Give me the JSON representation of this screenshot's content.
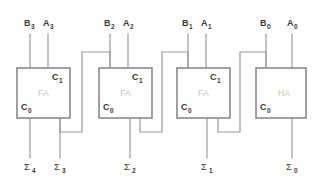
{
  "diagram": {
    "colors": {
      "background": "#ffffff",
      "wire": "#9a9a9a",
      "box_border": "#8a8a8a",
      "box_fill": "#ffffff",
      "text": "#3a3a3a",
      "block_label": "#c2c2c2"
    },
    "blocks": [
      {
        "id": "fa3",
        "type_label": "FA",
        "x": 17,
        "y": 68,
        "w": 53,
        "h": 50,
        "carry_out_label": "C",
        "carry_out_sub": "1",
        "carry_in_label": "C",
        "carry_in_sub": "0",
        "input_b": "B",
        "input_b_sub": "3",
        "input_a": "A",
        "input_a_sub": "3",
        "sum_label": "Σ",
        "sum_sub": "3",
        "extra_sum_label": "Σ",
        "extra_sum_sub": "4"
      },
      {
        "id": "fa2",
        "type_label": "FA",
        "x": 99,
        "y": 68,
        "w": 53,
        "h": 50,
        "carry_out_label": "C",
        "carry_out_sub": "1",
        "carry_in_label": "C",
        "carry_in_sub": "0",
        "input_b": "B",
        "input_b_sub": "2",
        "input_a": "A",
        "input_a_sub": "2",
        "sum_label": "Σ",
        "sum_sub": "2"
      },
      {
        "id": "fa1",
        "type_label": "FA",
        "x": 177,
        "y": 68,
        "w": 53,
        "h": 50,
        "carry_out_label": "C",
        "carry_out_sub": "1",
        "carry_in_label": "C",
        "carry_in_sub": "0",
        "input_b": "B",
        "input_b_sub": "1",
        "input_a": "A",
        "input_a_sub": "1",
        "sum_label": "Σ",
        "sum_sub": "1"
      },
      {
        "id": "ha0",
        "type_label": "HA",
        "x": 256,
        "y": 68,
        "w": 50,
        "h": 50,
        "carry_out_label": "",
        "carry_out_sub": "",
        "carry_in_label": "C",
        "carry_in_sub": "0",
        "input_b": "B",
        "input_b_sub": "0",
        "input_a": "A",
        "input_a_sub": "0",
        "sum_label": "Σ",
        "sum_sub": "0"
      }
    ],
    "inputs_top": [
      {
        "name": "B",
        "sub": "3",
        "x": 30,
        "label_x": 24,
        "label_y": 26
      },
      {
        "name": "A",
        "sub": "3",
        "x": 48,
        "label_x": 43,
        "label_y": 26
      },
      {
        "name": "B",
        "sub": "2",
        "x": 110,
        "label_x": 104,
        "label_y": 26
      },
      {
        "name": "A",
        "sub": "2",
        "x": 128,
        "label_x": 123,
        "label_y": 26
      },
      {
        "name": "B",
        "sub": "1",
        "x": 188,
        "label_x": 182,
        "label_y": 26
      },
      {
        "name": "A",
        "sub": "1",
        "x": 206,
        "label_x": 201,
        "label_y": 26
      },
      {
        "name": "B",
        "sub": "0",
        "x": 266,
        "label_x": 260,
        "label_y": 26
      },
      {
        "name": "A",
        "sub": "0",
        "x": 292,
        "label_x": 287,
        "label_y": 26
      }
    ],
    "outputs_bottom": [
      {
        "name": "Σ",
        "sub": "4",
        "x": 30,
        "label_x": 24,
        "label_y": 170
      },
      {
        "name": "Σ",
        "sub": "3",
        "x": 60,
        "label_x": 54,
        "label_y": 170
      },
      {
        "name": "Σ",
        "sub": "2",
        "x": 130,
        "label_x": 124,
        "label_y": 170
      },
      {
        "name": "Σ",
        "sub": "1",
        "x": 207,
        "label_x": 201,
        "label_y": 170
      },
      {
        "name": "Σ",
        "sub": "0",
        "x": 292,
        "label_x": 286,
        "label_y": 170
      }
    ],
    "carry_chain": [
      {
        "from": "ha0",
        "to": "fa1",
        "out_x": 266,
        "top_y": 132,
        "mid_x": 240,
        "bottom_y": 52,
        "in_x": 218
      },
      {
        "from": "fa1",
        "to": "fa2",
        "out_x": 188,
        "top_y": 132,
        "mid_x": 162,
        "bottom_y": 52,
        "in_x": 140
      },
      {
        "from": "fa2",
        "to": "fa3",
        "out_x": 110,
        "top_y": 132,
        "mid_x": 82,
        "bottom_y": 52,
        "in_x": 60
      }
    ]
  }
}
